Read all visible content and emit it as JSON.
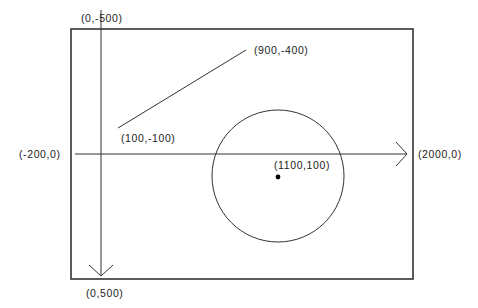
{
  "diagram": {
    "type": "coordinate-system-drawing",
    "colors": {
      "stroke": "#333333",
      "background": "#ffffff",
      "text": "#222222"
    },
    "labels": {
      "y_axis_top": "(0,-500)",
      "y_axis_bottom": "(0,500)",
      "x_axis_left": "(-200,0)",
      "x_axis_right": "(2000,0)",
      "line_start": "(100,-100)",
      "line_end": "(900,-400)",
      "circle_center": "(1100,100)"
    },
    "shapes": {
      "line": {
        "from": [
          100,
          -100
        ],
        "to": [
          900,
          -400
        ]
      },
      "circle": {
        "center": [
          1100,
          100
        ]
      }
    }
  }
}
